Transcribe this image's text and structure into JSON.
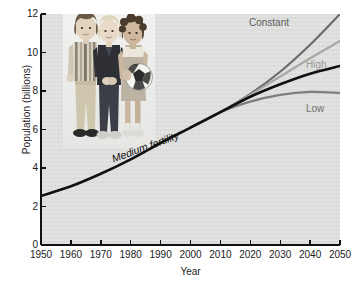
{
  "figure": {
    "background_color": "#ffffff",
    "panel_color": "#dededc"
  },
  "axes": {
    "xlabel": "Year",
    "ylabel": "Population (billions)",
    "xticks": [
      "1950",
      "1960",
      "1970",
      "1980",
      "1990",
      "2000",
      "2010",
      "2020",
      "2030",
      "2040",
      "2050"
    ],
    "yticks": [
      "0",
      "2",
      "4",
      "6",
      "8",
      "10",
      "12"
    ]
  },
  "labels": {
    "constant": "Constant",
    "high": "High",
    "low": "Low",
    "medium": "Medium fertility"
  },
  "photo": {
    "alt": "Three children standing together, one holding a soccer ball"
  },
  "chart_data": {
    "type": "line",
    "title": "",
    "xlabel": "Year",
    "ylabel": "Population (billions)",
    "xlim": [
      1950,
      2050
    ],
    "ylim": [
      0,
      12
    ],
    "xticks": [
      1950,
      1960,
      1970,
      1980,
      1990,
      2000,
      2010,
      2020,
      2030,
      2040,
      2050
    ],
    "yticks": [
      0,
      2,
      4,
      6,
      8,
      10,
      12
    ],
    "grid": false,
    "legend": "inline-labels-right",
    "series": [
      {
        "name": "Medium fertility",
        "color": "#111111",
        "linewidth": 2.6,
        "x": [
          1950,
          1960,
          1970,
          1980,
          1990,
          2000,
          2010,
          2020,
          2030,
          2040,
          2050
        ],
        "y": [
          2.55,
          3.05,
          3.7,
          4.45,
          5.3,
          6.1,
          6.9,
          7.7,
          8.35,
          8.9,
          9.3
        ]
      },
      {
        "name": "Constant",
        "color": "#6b6b6b",
        "linewidth": 2.2,
        "x": [
          2000,
          2010,
          2020,
          2030,
          2040,
          2050
        ],
        "y": [
          6.1,
          6.9,
          7.85,
          9.0,
          10.4,
          12.0
        ]
      },
      {
        "name": "High",
        "color": "#a8a8a8",
        "linewidth": 2.2,
        "x": [
          2000,
          2010,
          2020,
          2030,
          2040,
          2050
        ],
        "y": [
          6.1,
          6.9,
          7.8,
          8.75,
          9.7,
          10.6
        ]
      },
      {
        "name": "Low",
        "color": "#7d7d7d",
        "linewidth": 2.2,
        "x": [
          2000,
          2010,
          2020,
          2030,
          2040,
          2050
        ],
        "y": [
          6.1,
          6.9,
          7.45,
          7.8,
          7.95,
          7.9
        ]
      }
    ],
    "annotations": [
      {
        "text": "Medium fertility",
        "x": 1985,
        "y": 5.0,
        "rotation": -20,
        "style": "italic"
      },
      {
        "text": "Constant",
        "x": 2035,
        "y": 11.2
      },
      {
        "text": "High",
        "x": 2051,
        "y": 9.2
      },
      {
        "text": "Low",
        "x": 2051,
        "y": 6.9
      }
    ]
  }
}
